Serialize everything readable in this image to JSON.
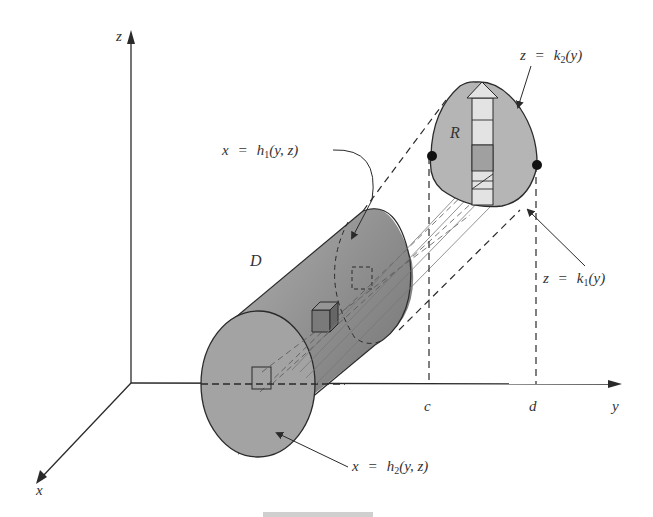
{
  "figure": {
    "axes": {
      "x_label": "x",
      "y_label": "y",
      "z_label": "z"
    },
    "solid_label": "D",
    "region_label": "R",
    "y_ticks": {
      "c": "c",
      "d": "d"
    },
    "equations": {
      "h1": {
        "lhs": "x",
        "eq": "=",
        "fn": "h",
        "sub": "1",
        "args": "(y, z)"
      },
      "h2": {
        "lhs": "x",
        "eq": "=",
        "fn": "h",
        "sub": "2",
        "args": "(y, z)"
      },
      "k1": {
        "lhs": "z",
        "eq": "=",
        "fn": "k",
        "sub": "1",
        "args": "(y)"
      },
      "k2": {
        "lhs": "z",
        "eq": "=",
        "fn": "k",
        "sub": "2",
        "args": "(y)"
      }
    },
    "colors": {
      "line": "#2a2a2a",
      "cylinder_fill": "#8c8c8c",
      "cylinder_face": "#a8a8a8",
      "region_fill": "#b5b5b5",
      "strip_fill": "#e3e3e3"
    }
  }
}
